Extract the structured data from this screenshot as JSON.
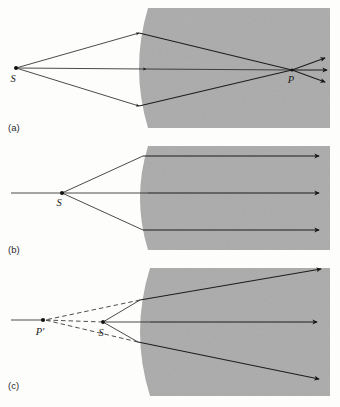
{
  "figure": {
    "type": "optics-ray-diagram",
    "background_color": "#fdfdfc",
    "medium_color": "#ababab",
    "ray_color": "#1d1d1d",
    "panels": [
      {
        "id": "a",
        "label": "(a)",
        "label_x": 12,
        "label_y": 131,
        "case": "converging-real-image",
        "medium": {
          "left_plane_x": 148,
          "right_x": 330,
          "top_y": 8,
          "bottom_y": 128,
          "surface_shape": "convex-left",
          "surface_bulge": 18
        },
        "source": {
          "name": "S",
          "label": "S",
          "x": 16,
          "y": 68,
          "label_x": 13,
          "label_y": 82
        },
        "image_point": {
          "name": "P",
          "label": "P",
          "x": 292,
          "y": 70,
          "label_x": 290,
          "label_y": 83
        },
        "rays": [
          {
            "name": "upper-ray",
            "from": [
              16,
              68
            ],
            "bend": [
              139,
              33
            ],
            "to": [
              292,
              70
            ],
            "arrow_at_bend": true
          },
          {
            "name": "axial-ray",
            "from": [
              16,
              68
            ],
            "bend": [
              148,
              69
            ],
            "to": [
              292,
              70
            ],
            "arrow_at_bend": true
          },
          {
            "name": "lower-ray",
            "from": [
              16,
              68
            ],
            "bend": [
              139,
              106
            ],
            "to": [
              292,
              70
            ],
            "arrow_at_bend": true
          }
        ],
        "exit_rays": [
          {
            "name": "exit-upper",
            "from": [
              292,
              70
            ],
            "to": [
              326,
              58
            ]
          },
          {
            "name": "exit-middle",
            "from": [
              292,
              70
            ],
            "to": [
              328,
              70
            ]
          },
          {
            "name": "exit-lower",
            "from": [
              292,
              70
            ],
            "to": [
              326,
              82
            ]
          }
        ]
      },
      {
        "id": "b",
        "label": "(b)",
        "label_x": 12,
        "label_y": 253,
        "case": "parallel-image-at-infinity",
        "medium": {
          "left_plane_x": 148,
          "right_x": 330,
          "top_y": 146,
          "bottom_y": 250,
          "surface_shape": "convex-left",
          "surface_bulge": 16
        },
        "source": {
          "name": "S",
          "label": "S",
          "x": 62,
          "y": 193,
          "label_x": 59,
          "label_y": 206
        },
        "axis": {
          "name": "optical-axis",
          "from": [
            11,
            193
          ],
          "to": [
            62,
            193
          ]
        },
        "rays": [
          {
            "name": "upper-ray",
            "from": [
              62,
              193
            ],
            "bend": [
              143,
              156
            ],
            "to": [
              320,
              156
            ]
          },
          {
            "name": "axial-ray",
            "from": [
              62,
              193
            ],
            "bend": [
              148,
              193
            ],
            "to": [
              320,
              193
            ]
          },
          {
            "name": "lower-ray",
            "from": [
              62,
              193
            ],
            "bend": [
              143,
              230
            ],
            "to": [
              320,
              230
            ]
          }
        ]
      },
      {
        "id": "c",
        "label": "(c)",
        "label_x": 12,
        "label_y": 389,
        "case": "diverging-virtual-image",
        "medium": {
          "left_plane_x": 150,
          "right_x": 330,
          "top_y": 268,
          "bottom_y": 396,
          "surface_shape": "convex-left",
          "surface_bulge": 20
        },
        "source": {
          "name": "S",
          "label": "S",
          "x": 103,
          "y": 322,
          "label_x": 100,
          "label_y": 336
        },
        "virtual_image_point": {
          "name": "P-prime",
          "label": "P′",
          "x": 43,
          "y": 320,
          "label_x": 39,
          "label_y": 335
        },
        "rays": [
          {
            "name": "upper-ray",
            "from": [
              103,
              322
            ],
            "bend": [
              140,
              300
            ],
            "to": [
              322,
              268
            ]
          },
          {
            "name": "axial-ray",
            "from": [
              103,
              322
            ],
            "bend": [
              150,
              322
            ],
            "to": [
              318,
              322
            ]
          },
          {
            "name": "lower-ray",
            "from": [
              103,
              322
            ],
            "bend": [
              138,
              342
            ],
            "to": [
              320,
              380
            ]
          }
        ],
        "virtual_extensions": [
          {
            "name": "dashed-upper",
            "from": [
              43,
              320
            ],
            "to": [
              140,
              300
            ]
          },
          {
            "name": "dashed-lower",
            "from": [
              43,
              320
            ],
            "to": [
              138,
              342
            ]
          },
          {
            "name": "dashed-axis",
            "from": [
              43,
              320
            ],
            "to": [
              103,
              322
            ]
          }
        ]
      }
    ]
  }
}
